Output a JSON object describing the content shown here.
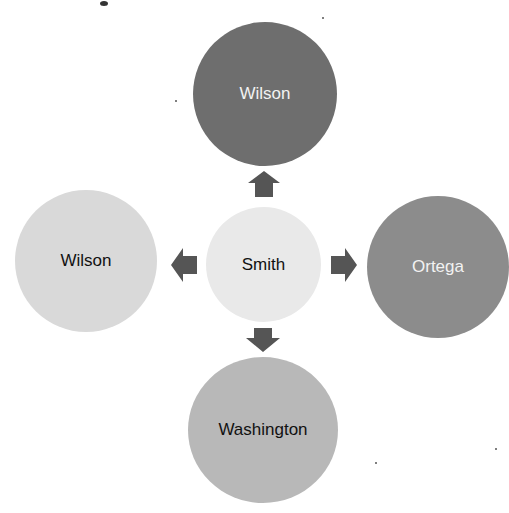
{
  "diagram": {
    "type": "radial-cycle",
    "center": {
      "label": "Smith",
      "color": "#e9e9e9",
      "text_color": "#111111"
    },
    "nodes": [
      {
        "id": "top",
        "label": "Wilson",
        "color": "#6e6e6e",
        "text_color": "#f2f2f2"
      },
      {
        "id": "left",
        "label": "Wilson",
        "color": "#d9d9d9",
        "text_color": "#111111"
      },
      {
        "id": "right",
        "label": "Ortega",
        "color": "#8c8c8c",
        "text_color": "#f2f2f2"
      },
      {
        "id": "bottom",
        "label": "Washington",
        "color": "#b8b8b8",
        "text_color": "#111111"
      }
    ],
    "arrow_color": "#555555"
  }
}
